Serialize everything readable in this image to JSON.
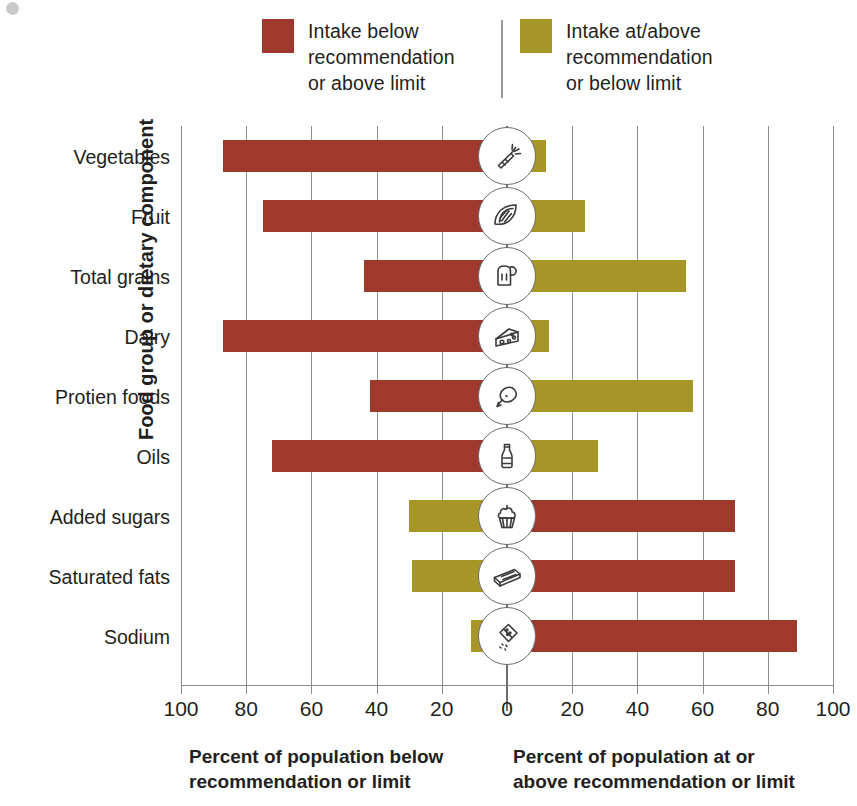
{
  "legend": {
    "divider": true,
    "items": [
      {
        "label": "Intake below\nrecommendation\nor above limit",
        "color": "#9d3a2d",
        "name": "below-recommendation"
      },
      {
        "label": "Intake at/above\nrecommendation\nor below limit",
        "color": "#a69527",
        "name": "at-above-recommendation"
      }
    ]
  },
  "axes": {
    "y_title": "Food group or dietary component",
    "x_title_left": "Percent of population below\nrecommendation or limit",
    "x_title_right": "Percent of population at or\nabove recommendation or limit",
    "x_ticks": [
      "100",
      "80",
      "60",
      "40",
      "20",
      "0",
      "20",
      "40",
      "60",
      "80",
      "100"
    ]
  },
  "chart_data": {
    "type": "bar",
    "title": "",
    "subtitle": "",
    "orientation": "horizontal",
    "layout": "diverging",
    "xlabel_left": "Percent of population below recommendation or limit",
    "xlabel_right": "Percent of population at or above recommendation or limit",
    "ylabel": "Food group or dietary component",
    "xlim": [
      -100,
      100
    ],
    "xticks": [
      100,
      80,
      60,
      40,
      20,
      0,
      20,
      40,
      60,
      80,
      100
    ],
    "grid": true,
    "legend_position": "top",
    "categories": [
      "Vegetables",
      "Fruit",
      "Total grains",
      "Dairy",
      "Protien foods",
      "Oils",
      "Added sugars",
      "Saturated fats",
      "Sodium"
    ],
    "series": [
      {
        "name": "Intake below recommendation or above limit",
        "color": "#9d3a2d",
        "values": [
          87,
          75,
          44,
          87,
          42,
          72,
          70,
          70,
          89
        ]
      },
      {
        "name": "Intake at/above recommendation or below limit",
        "color": "#a69527",
        "values": [
          12,
          24,
          55,
          13,
          57,
          28,
          30,
          29,
          11
        ]
      }
    ],
    "rows": [
      {
        "category": "Vegetables",
        "icon": "carrot-icon",
        "left_value": 87,
        "right_value": 12,
        "left_color": "#9d3a2d",
        "right_color": "#a69527"
      },
      {
        "category": "Fruit",
        "icon": "citrus-icon",
        "left_value": 75,
        "right_value": 24,
        "left_color": "#9d3a2d",
        "right_color": "#a69527"
      },
      {
        "category": "Total grains",
        "icon": "bread-icon",
        "left_value": 44,
        "right_value": 55,
        "left_color": "#9d3a2d",
        "right_color": "#a69527"
      },
      {
        "category": "Dairy",
        "icon": "cheese-icon",
        "left_value": 87,
        "right_value": 13,
        "left_color": "#9d3a2d",
        "right_color": "#a69527"
      },
      {
        "category": "Protien foods",
        "icon": "drumstick-icon",
        "left_value": 42,
        "right_value": 57,
        "left_color": "#9d3a2d",
        "right_color": "#a69527"
      },
      {
        "category": "Oils",
        "icon": "oil-bottle-icon",
        "left_value": 72,
        "right_value": 28,
        "left_color": "#9d3a2d",
        "right_color": "#a69527"
      },
      {
        "category": "Added sugars",
        "icon": "cupcake-icon",
        "left_value": 30,
        "right_value": 70,
        "left_color": "#a69527",
        "right_color": "#9d3a2d"
      },
      {
        "category": "Saturated fats",
        "icon": "butter-icon",
        "left_value": 29,
        "right_value": 70,
        "left_color": "#a69527",
        "right_color": "#9d3a2d"
      },
      {
        "category": "Sodium",
        "icon": "salt-shaker-icon",
        "left_value": 11,
        "right_value": 89,
        "left_color": "#a69527",
        "right_color": "#9d3a2d"
      }
    ]
  }
}
